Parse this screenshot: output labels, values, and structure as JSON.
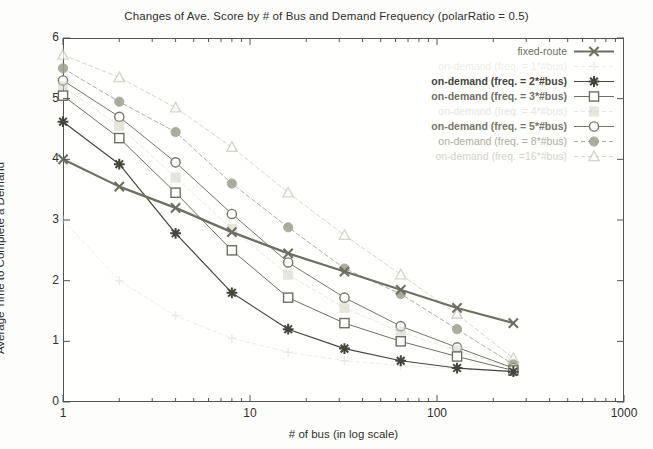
{
  "chart_data": {
    "type": "line",
    "title": "Changes of Ave. Score by # of Bus and Demand Frequency (polarRatio = 0.5)",
    "xlabel": "# of bus (in log scale)",
    "ylabel": "Average Time to Complete a Demand",
    "xscale": "log",
    "xlim": [
      1,
      1000
    ],
    "ylim": [
      0,
      6
    ],
    "xticks": [
      1,
      10,
      100,
      1000
    ],
    "xtick_labels": [
      "1",
      "10",
      "100",
      "1000"
    ],
    "yticks": [
      0,
      1,
      2,
      3,
      4,
      5,
      6
    ],
    "ytick_labels": [
      "0",
      "1",
      "2",
      "3",
      "4",
      "5",
      "6"
    ],
    "grid": false,
    "legend_position": "top-right",
    "x": [
      1,
      2,
      4,
      8,
      16,
      32,
      64,
      128,
      256
    ],
    "series": [
      {
        "name": "fixed-route",
        "marker": "x",
        "color": "#6e6e63",
        "opacity": 1.0,
        "linewidth": 2.2,
        "dashed": false,
        "values": [
          4.0,
          3.55,
          3.2,
          2.8,
          2.45,
          2.15,
          1.85,
          1.55,
          1.3
        ]
      },
      {
        "name": "on-demand (freq. = 1*#bus)",
        "marker": "plus",
        "color": "#d8d8cc",
        "opacity": 0.45,
        "linewidth": 1.0,
        "dashed": true,
        "values": [
          3.0,
          2.0,
          1.42,
          1.05,
          0.82,
          0.68,
          0.6,
          0.55,
          0.5
        ]
      },
      {
        "name": "on-demand (freq. = 2*#bus)",
        "marker": "star",
        "color": "#45453e",
        "opacity": 1.0,
        "linewidth": 1.2,
        "dashed": false,
        "values": [
          4.62,
          3.92,
          2.78,
          1.8,
          1.2,
          0.88,
          0.68,
          0.56,
          0.5
        ]
      },
      {
        "name": "on-demand (freq. = 3*#bus)",
        "marker": "square-open",
        "color": "#6f6f64",
        "opacity": 1.0,
        "linewidth": 1.0,
        "dashed": false,
        "values": [
          5.05,
          4.35,
          3.45,
          2.5,
          1.72,
          1.3,
          1.0,
          0.75,
          0.52
        ]
      },
      {
        "name": "on-demand (freq. = 4*#bus)",
        "marker": "square-filled",
        "color": "#cfcfc2",
        "opacity": 0.5,
        "linewidth": 1.0,
        "dashed": true,
        "values": [
          5.2,
          4.55,
          3.7,
          2.85,
          2.1,
          1.55,
          1.15,
          0.85,
          0.55
        ]
      },
      {
        "name": "on-demand (freq. = 5*#bus)",
        "marker": "circle-open",
        "color": "#767669",
        "opacity": 1.0,
        "linewidth": 1.0,
        "dashed": false,
        "values": [
          5.3,
          4.7,
          3.95,
          3.1,
          2.3,
          1.72,
          1.25,
          0.9,
          0.56
        ]
      },
      {
        "name": "on-demand (freq. = 8*#bus)",
        "marker": "circle-filled",
        "color": "#9e9e90",
        "opacity": 0.85,
        "linewidth": 1.0,
        "dashed": true,
        "values": [
          5.5,
          4.95,
          4.45,
          3.6,
          2.88,
          2.2,
          1.78,
          1.2,
          0.62
        ]
      },
      {
        "name": "on-demand (freq. =16*#bus)",
        "marker": "triangle-open",
        "color": "#c2c2b2",
        "opacity": 0.7,
        "linewidth": 1.0,
        "dashed": true,
        "values": [
          5.72,
          5.35,
          4.85,
          4.2,
          3.45,
          2.75,
          2.1,
          1.45,
          0.72
        ]
      }
    ]
  },
  "legend": {
    "items": [
      {
        "label": "fixed-route",
        "series": 0
      },
      {
        "label": "on-demand (freq. = 1*#bus)",
        "series": 1
      },
      {
        "label": "on-demand (freq. = 2*#bus)",
        "series": 2
      },
      {
        "label": "on-demand (freq. = 3*#bus)",
        "series": 3
      },
      {
        "label": "on-demand (freq. = 4*#bus)",
        "series": 4
      },
      {
        "label": "on-demand (freq. = 5*#bus)",
        "series": 5
      },
      {
        "label": "on-demand (freq. = 8*#bus)",
        "series": 6
      },
      {
        "label": "on-demand (freq. =16*#bus)",
        "series": 7
      }
    ]
  }
}
